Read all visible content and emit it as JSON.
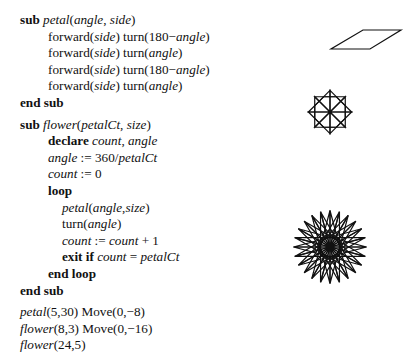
{
  "code": {
    "lines": [
      {
        "indent": 0,
        "parts": [
          {
            "t": "sub",
            "s": "kw"
          },
          {
            "t": " ",
            "s": ""
          },
          {
            "t": "petal",
            "s": "it"
          },
          {
            "t": "(",
            "s": ""
          },
          {
            "t": "angle",
            "s": "it"
          },
          {
            "t": ", ",
            "s": ""
          },
          {
            "t": "side",
            "s": "it"
          },
          {
            "t": ")",
            "s": ""
          }
        ]
      },
      {
        "indent": 1,
        "parts": [
          {
            "t": "forward(",
            "s": ""
          },
          {
            "t": "side",
            "s": "it"
          },
          {
            "t": ") turn(180−",
            "s": ""
          },
          {
            "t": "angle",
            "s": "it"
          },
          {
            "t": ")",
            "s": ""
          }
        ]
      },
      {
        "indent": 1,
        "parts": [
          {
            "t": "forward(",
            "s": ""
          },
          {
            "t": "side",
            "s": "it"
          },
          {
            "t": ") turn(",
            "s": ""
          },
          {
            "t": "angle",
            "s": "it"
          },
          {
            "t": ")",
            "s": ""
          }
        ]
      },
      {
        "indent": 1,
        "parts": [
          {
            "t": "forward(",
            "s": ""
          },
          {
            "t": "side",
            "s": "it"
          },
          {
            "t": ") turn(180−",
            "s": ""
          },
          {
            "t": "angle",
            "s": "it"
          },
          {
            "t": ")",
            "s": ""
          }
        ]
      },
      {
        "indent": 1,
        "parts": [
          {
            "t": "forward(",
            "s": ""
          },
          {
            "t": "side",
            "s": "it"
          },
          {
            "t": ") turn(",
            "s": ""
          },
          {
            "t": "angle",
            "s": "it"
          },
          {
            "t": ")",
            "s": ""
          }
        ]
      },
      {
        "indent": 0,
        "parts": [
          {
            "t": "end sub",
            "s": "kw"
          }
        ]
      },
      {
        "gap": true
      },
      {
        "indent": 0,
        "parts": [
          {
            "t": "sub",
            "s": "kw"
          },
          {
            "t": " ",
            "s": ""
          },
          {
            "t": "flower",
            "s": "it"
          },
          {
            "t": "(",
            "s": ""
          },
          {
            "t": "petalCt",
            "s": "it"
          },
          {
            "t": ", ",
            "s": ""
          },
          {
            "t": "size",
            "s": "it"
          },
          {
            "t": ")",
            "s": ""
          }
        ]
      },
      {
        "indent": 1,
        "parts": [
          {
            "t": "declare",
            "s": "kw"
          },
          {
            "t": " ",
            "s": ""
          },
          {
            "t": "count",
            "s": "it"
          },
          {
            "t": ", ",
            "s": ""
          },
          {
            "t": "angle",
            "s": "it"
          }
        ]
      },
      {
        "indent": 1,
        "parts": [
          {
            "t": "angle",
            "s": "it"
          },
          {
            "t": " := 360/",
            "s": ""
          },
          {
            "t": "petalCt",
            "s": "it"
          }
        ]
      },
      {
        "indent": 1,
        "parts": [
          {
            "t": "count",
            "s": "it"
          },
          {
            "t": " := 0",
            "s": ""
          }
        ]
      },
      {
        "indent": 1,
        "parts": [
          {
            "t": "loop",
            "s": "kw"
          }
        ]
      },
      {
        "indent": 2,
        "parts": [
          {
            "t": "petal",
            "s": "it"
          },
          {
            "t": "(",
            "s": ""
          },
          {
            "t": "angle",
            "s": "it"
          },
          {
            "t": ",",
            "s": ""
          },
          {
            "t": "size",
            "s": "it"
          },
          {
            "t": ")",
            "s": ""
          }
        ]
      },
      {
        "indent": 2,
        "parts": [
          {
            "t": "turn(",
            "s": ""
          },
          {
            "t": "angle",
            "s": "it"
          },
          {
            "t": ")",
            "s": ""
          }
        ]
      },
      {
        "indent": 2,
        "parts": [
          {
            "t": "count",
            "s": "it"
          },
          {
            "t": " := ",
            "s": ""
          },
          {
            "t": "count",
            "s": "it"
          },
          {
            "t": " + 1",
            "s": ""
          }
        ]
      },
      {
        "indent": 2,
        "parts": [
          {
            "t": "exit if",
            "s": "kw"
          },
          {
            "t": " ",
            "s": ""
          },
          {
            "t": "count",
            "s": "it"
          },
          {
            "t": " = ",
            "s": ""
          },
          {
            "t": "petalCt",
            "s": "it"
          }
        ]
      },
      {
        "indent": 1,
        "parts": [
          {
            "t": "end loop",
            "s": "kw"
          }
        ]
      },
      {
        "indent": 0,
        "parts": [
          {
            "t": "end sub",
            "s": "kw"
          }
        ]
      },
      {
        "gap": true
      },
      {
        "indent": 0,
        "parts": [
          {
            "t": "petal",
            "s": "it"
          },
          {
            "t": "(5,30) Move(0,−8)",
            "s": ""
          }
        ]
      },
      {
        "indent": 0,
        "parts": [
          {
            "t": "flower",
            "s": "it"
          },
          {
            "t": "(8,3) Move(0,−16)",
            "s": ""
          }
        ]
      },
      {
        "indent": 0,
        "parts": [
          {
            "t": "flower",
            "s": "it"
          },
          {
            "t": "(24,5)",
            "s": ""
          }
        ]
      }
    ]
  },
  "figures": {
    "stroke": "#111111",
    "shapes": [
      {
        "name": "parallelogram-petal",
        "type": "polygon",
        "points": [
          [
            331,
            49
          ],
          [
            370,
            49
          ],
          [
            401,
            30
          ],
          [
            363,
            30
          ]
        ]
      },
      {
        "name": "flower-8-petals",
        "type": "flower",
        "cx": 330,
        "cy": 112,
        "petals": 8,
        "side": 21.6
      },
      {
        "name": "flower-24-petals",
        "type": "flower",
        "cx": 330,
        "cy": 247,
        "petals": 24,
        "side": 36.5
      }
    ]
  }
}
